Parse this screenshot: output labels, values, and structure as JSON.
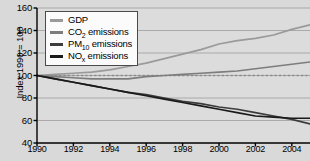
{
  "chart_data": {
    "type": "line",
    "title": "",
    "xlabel": "",
    "ylabel": "Index 1990 = 100",
    "xlim": [
      1990,
      2005
    ],
    "ylim": [
      40,
      160
    ],
    "yticks": [
      160,
      140,
      120,
      100,
      80,
      60,
      40
    ],
    "xticks": [
      1990,
      1992,
      1994,
      1996,
      1998,
      2000,
      2002,
      2004
    ],
    "grid": "horizontal",
    "legend_position": "upper-left-inside",
    "reference_line": {
      "value": 100,
      "style": "dashed",
      "color": "#8a8a8a"
    },
    "x": [
      1990,
      1991,
      1992,
      1993,
      1994,
      1995,
      1996,
      1997,
      1998,
      1999,
      2000,
      2001,
      2002,
      2003,
      2004,
      2005
    ],
    "series": [
      {
        "name": "GDP",
        "color": "#9a9a9a",
        "values": [
          100,
          101,
          102,
          103,
          105,
          108,
          111,
          115,
          119,
          123,
          128,
          131,
          133,
          136,
          141,
          145
        ]
      },
      {
        "name": "CO2 emissions",
        "color": "#7d7d7d",
        "values": [
          100,
          99,
          98,
          97,
          97,
          97,
          99,
          100,
          101,
          102,
          103,
          104,
          106,
          108,
          110,
          112
        ]
      },
      {
        "name": "PM10 emissions",
        "color": "#3c3c3c",
        "values": [
          100,
          97,
          94,
          91,
          88,
          85,
          83,
          80,
          77,
          75,
          72,
          70,
          67,
          64,
          61,
          57
        ]
      },
      {
        "name": "NOx emissions",
        "color": "#1a1a1a",
        "values": [
          100,
          97,
          94,
          91,
          88,
          85,
          82,
          79,
          76,
          73,
          70,
          67,
          64,
          63,
          62,
          62
        ]
      }
    ],
    "legend": [
      {
        "label": "GDP",
        "sub": "",
        "tail": "",
        "color": "#9a9a9a"
      },
      {
        "label": "CO",
        "sub": "2",
        "tail": " emissions",
        "color": "#7d7d7d"
      },
      {
        "label": "PM",
        "sub": "10",
        "tail": " emissions",
        "color": "#3c3c3c"
      },
      {
        "label": "NO",
        "sub": "x",
        "tail": " emissions",
        "color": "#1a1a1a"
      }
    ]
  }
}
